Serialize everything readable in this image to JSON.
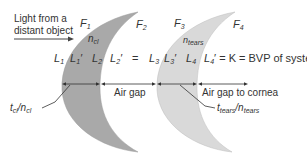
{
  "diagram": {
    "incoming_light_label_line1": "Light from a",
    "incoming_light_label_line2": "distant object",
    "lens1": {
      "front_surface": "F1",
      "back_surface": "F2",
      "index_label": "n",
      "index_sub": "cl",
      "thickness_label": "t",
      "thickness_sub": "cl",
      "thickness_sep": "/n",
      "thickness_sub2": "cl",
      "fill": "#a9a9a9"
    },
    "lens2": {
      "front_surface": "F3",
      "back_surface": "F4",
      "index_label": "n",
      "index_sub": "tears",
      "thickness_label": "t",
      "thickness_sub": "tears",
      "thickness_sep": "/n",
      "thickness_sub2": "tears",
      "fill": "#d9d9d9"
    },
    "vergences": {
      "L1": "L",
      "L1_sub": "1",
      "L1p": "L",
      "L1p_sub": "1",
      "L2": "L",
      "L2_sub": "2",
      "L2p": "L",
      "L2p_sub": "2",
      "eq": "=",
      "L3": "L",
      "L3_sub": "3",
      "L3p": "L",
      "L3p_sub": "3",
      "L4": "L",
      "L4_sub": "4",
      "L4p": "L",
      "L4p_sub": "4",
      "result": "= K = BVP of system"
    },
    "gaps": {
      "air_gap": "Air gap",
      "air_gap_cornea": "Air gap to cornea"
    }
  }
}
